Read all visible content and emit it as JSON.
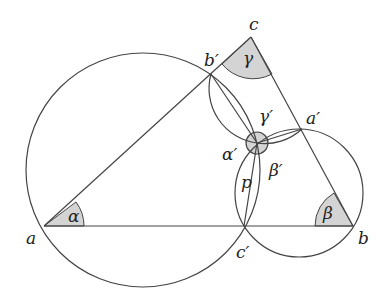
{
  "diagram": {
    "points": {
      "a": {
        "label": "a",
        "x": 44,
        "y": 226
      },
      "b": {
        "label": "b",
        "x": 353,
        "y": 226
      },
      "c": {
        "label": "c",
        "x": 251,
        "y": 37
      },
      "a_prime": {
        "label": "a′",
        "x": 302,
        "y": 129
      },
      "b_prime": {
        "label": "b′",
        "x": 211,
        "y": 74
      },
      "c_prime": {
        "label": "c′",
        "x": 244,
        "y": 226
      },
      "p": {
        "label": "p",
        "x": 257,
        "y": 143
      }
    },
    "angles": {
      "alpha": "α",
      "beta": "β",
      "gamma": "γ",
      "alpha_prime": "α′",
      "beta_prime": "β′",
      "gamma_prime": "γ′"
    },
    "colors": {
      "stroke": "#444444",
      "fill": "#d4d4d4"
    }
  }
}
